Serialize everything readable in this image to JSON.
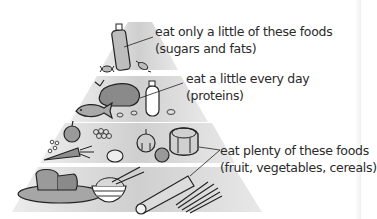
{
  "tiers": [
    {
      "level": "top",
      "line1": "eat only a little of these foods",
      "line2": "(sugars and fats)",
      "items": [
        "bottle-of-oil",
        "sweet",
        "sweet"
      ]
    },
    {
      "level": "second",
      "line1": "eat a little every day",
      "line2": "(proteins)",
      "items": [
        "roast-chicken",
        "fish",
        "milk-bottle",
        "beans"
      ]
    },
    {
      "level": "third-and-bottom",
      "line1": "eat plenty of these foods",
      "line2": "(fruit, vegetables, cereals)",
      "items": [
        "apple",
        "grapes",
        "peas",
        "carrot",
        "lemon",
        "onion",
        "orange",
        "pineapple",
        "bread",
        "rice-bowl",
        "chopsticks",
        "pasta",
        "spaghetti"
      ]
    }
  ],
  "colors": {
    "tier_fill": "#d2d2d2",
    "tier_fill_light": "#e6e6e6",
    "ink": "#222222",
    "text": "#2a2a2a"
  }
}
